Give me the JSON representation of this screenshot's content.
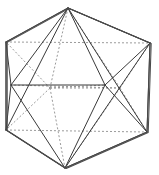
{
  "figure": {
    "shape_name": "icosahedron",
    "canvas": {
      "width": 159,
      "height": 175
    },
    "style": {
      "background_color": "#ffffff",
      "visible_edge_color": "#3a3a3a",
      "hidden_edge_color": "#8f8f8f",
      "visible_edge_width": 1,
      "hidden_edge_width": 0.9,
      "hidden_edge_dash": "2 2"
    },
    "counts": {
      "vertices": 12,
      "edges": 30,
      "faces": 20
    },
    "vertices": {
      "top_apex": [
        68,
        8
      ],
      "upper_right": [
        150,
        43
      ],
      "lower_right": [
        147,
        132
      ],
      "bottom_apex": [
        65,
        168
      ],
      "lower_left": [
        6,
        130
      ],
      "upper_left": [
        6,
        42
      ],
      "mid_left": [
        11,
        85
      ],
      "mid_right": [
        105,
        85
      ],
      "inner_upper_mid": [
        74,
        36
      ],
      "inner_lower_mid": [
        60,
        140
      ],
      "hidden_left": [
        50,
        88
      ],
      "hidden_right": [
        120,
        88
      ]
    },
    "edges_visible": [
      [
        "upper_left",
        "top_apex"
      ],
      [
        "top_apex",
        "upper_right"
      ],
      [
        "upper_right",
        "lower_right"
      ],
      [
        "lower_right",
        "bottom_apex"
      ],
      [
        "bottom_apex",
        "lower_left"
      ],
      [
        "lower_left",
        "upper_left"
      ],
      [
        "mid_left",
        "mid_right"
      ],
      [
        "mid_left",
        "upper_left"
      ],
      [
        "mid_left",
        "lower_left"
      ],
      [
        "mid_left",
        "top_apex"
      ],
      [
        "mid_left",
        "bottom_apex"
      ],
      [
        "mid_right",
        "top_apex"
      ],
      [
        "mid_right",
        "bottom_apex"
      ],
      [
        "mid_right",
        "upper_right"
      ],
      [
        "mid_right",
        "lower_right"
      ],
      [
        "top_apex",
        "lower_right"
      ],
      [
        "top_apex",
        "lower_left"
      ],
      [
        "bottom_apex",
        "upper_right"
      ]
    ],
    "edges_hidden": [
      [
        "hidden_left",
        "hidden_right"
      ],
      [
        "hidden_left",
        "upper_left"
      ],
      [
        "hidden_left",
        "lower_left"
      ],
      [
        "hidden_left",
        "top_apex"
      ],
      [
        "hidden_left",
        "bottom_apex"
      ],
      [
        "hidden_right",
        "upper_right"
      ],
      [
        "hidden_right",
        "lower_right"
      ],
      [
        "hidden_right",
        "top_apex"
      ],
      [
        "hidden_right",
        "bottom_apex"
      ],
      [
        "hidden_left",
        "mid_right"
      ],
      [
        "hidden_right",
        "mid_left"
      ],
      [
        "upper_left",
        "upper_right"
      ],
      [
        "lower_left",
        "lower_right"
      ]
    ]
  }
}
